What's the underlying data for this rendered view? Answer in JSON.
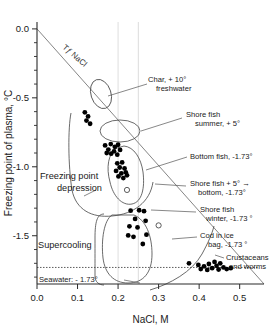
{
  "chart_data": {
    "type": "scatter",
    "title": "",
    "xlabel": "NaCl, M",
    "ylabel": "Freezing point of plasma, °C",
    "xlim": [
      0.0,
      0.56
    ],
    "ylim": [
      -1.85,
      0.05
    ],
    "xticks": [
      "0.0",
      "0.1",
      "0.2",
      "0.3",
      "0.4",
      "0.5"
    ],
    "xtick_values": [
      0.0,
      0.1,
      0.2,
      0.3,
      0.4,
      0.5
    ],
    "yticks": [
      "0.0",
      "-0.5",
      "-1.0",
      "-1.5"
    ],
    "ytick_values": [
      0.0,
      -0.5,
      -1.0,
      -1.5
    ],
    "ytick_minor_values": [
      -0.1,
      -0.2,
      -0.3,
      -0.4,
      -0.6,
      -0.7,
      -0.8,
      -0.9,
      -1.1,
      -1.2,
      -1.3,
      -1.4,
      -1.6,
      -1.7,
      -1.8
    ],
    "grid": "faint vertical gridlines at 0.20 and 0.25",
    "gridline_x_values": [
      0.2,
      0.25
    ],
    "legend_position": "none",
    "reference_lines": [
      {
        "name": "tf-nacl-line",
        "label": "Tƒ NaCl",
        "description": "freezing point depression line of NaCl solution",
        "from": [
          0.0,
          0.0
        ],
        "to": [
          0.56,
          -1.85
        ]
      },
      {
        "name": "seawater-line",
        "label": "Seawater: - 1.73°",
        "style": "dotted horizontal",
        "y_value": -1.73
      }
    ],
    "series": [
      {
        "name": "Char, + 10° freshwater",
        "marker": "filled-circle",
        "points": [
          [
            0.118,
            -0.605
          ],
          [
            0.126,
            -0.635
          ],
          [
            0.122,
            -0.665
          ],
          [
            0.131,
            -0.688
          ]
        ]
      },
      {
        "name": "Shore fish summer, + 5°",
        "marker": "filled-circle",
        "points": [
          [
            0.168,
            -0.845
          ],
          [
            0.182,
            -0.835
          ],
          [
            0.192,
            -0.855
          ],
          [
            0.2,
            -0.84
          ],
          [
            0.176,
            -0.875
          ],
          [
            0.19,
            -0.888
          ],
          [
            0.205,
            -0.878
          ],
          [
            0.183,
            -0.905
          ],
          [
            0.198,
            -0.912
          ],
          [
            0.172,
            -0.9
          ]
        ]
      },
      {
        "name": "Bottom fish, -1.73°",
        "marker": "filled-circle",
        "points": [
          [
            0.198,
            -0.975
          ],
          [
            0.21,
            -0.968
          ],
          [
            0.204,
            -1.005
          ],
          [
            0.216,
            -1.012
          ],
          [
            0.195,
            -1.03
          ],
          [
            0.208,
            -1.048
          ],
          [
            0.219,
            -1.04
          ],
          [
            0.201,
            -1.07
          ],
          [
            0.213,
            -1.082
          ],
          [
            0.222,
            -1.062
          ]
        ]
      },
      {
        "name": "Shore fish winter, -1.73° (open marker within bottom-fish envelope)",
        "marker": "open-circle",
        "points": [
          [
            0.222,
            -1.168
          ]
        ]
      },
      {
        "name": "Cod in ice bag, -1.73°",
        "marker": "open-circle",
        "points": [
          [
            0.3,
            -1.425
          ]
        ]
      },
      {
        "name": "Supercooling",
        "marker": "filled-circle",
        "points": [
          [
            0.231,
            -1.318
          ],
          [
            0.252,
            -1.315
          ],
          [
            0.264,
            -1.322
          ],
          [
            0.242,
            -1.378
          ],
          [
            0.268,
            -1.392
          ],
          [
            0.228,
            -1.432
          ],
          [
            0.248,
            -1.44
          ],
          [
            0.225,
            -1.498
          ],
          [
            0.238,
            -1.508
          ],
          [
            0.27,
            -1.492
          ],
          [
            0.261,
            -1.56
          ]
        ]
      },
      {
        "name": "Crustaceans and worms",
        "marker": "filled-circle",
        "points": [
          [
            0.375,
            -1.7
          ],
          [
            0.398,
            -1.712
          ],
          [
            0.404,
            -1.742
          ],
          [
            0.412,
            -1.722
          ],
          [
            0.42,
            -1.748
          ],
          [
            0.424,
            -1.705
          ],
          [
            0.432,
            -1.735
          ],
          [
            0.438,
            -1.69
          ],
          [
            0.443,
            -1.718
          ],
          [
            0.448,
            -1.745
          ],
          [
            0.452,
            -1.7
          ],
          [
            0.46,
            -1.73
          ],
          [
            0.468,
            -1.742
          ],
          [
            0.478,
            -1.735
          ]
        ]
      }
    ],
    "annotations": [
      {
        "name": "annotation-tf-nacl",
        "text": "Tƒ NaCl",
        "rotated": true
      },
      {
        "name": "annotation-char",
        "line1": "Char, + 10°",
        "line2": "freshwater"
      },
      {
        "name": "annotation-shore-fish-summer",
        "line1": "Shore fish",
        "line2": "summer, + 5°"
      },
      {
        "name": "annotation-bottom-fish",
        "line1": "Bottom fish, -1.73°",
        "line2": ""
      },
      {
        "name": "annotation-shore-fish-transition",
        "line1": "Shore fish + 5° →",
        "line2": "bottom, -1.73°"
      },
      {
        "name": "annotation-shore-fish-winter",
        "line1": "Shore fish",
        "line2": "winter, -1.73 °"
      },
      {
        "name": "annotation-cod-in-ice-bag",
        "line1": "Cod in ice",
        "line2": "bag, -1.73 °"
      },
      {
        "name": "annotation-crustaceans-worms",
        "line1": "Crustaceans",
        "line2": "and worms"
      },
      {
        "name": "annotation-freezing-point-depression",
        "line1": "Freezing point",
        "line2": "depression"
      },
      {
        "name": "annotation-supercooling",
        "line1": "Supercooling",
        "line2": ""
      },
      {
        "name": "annotation-seawater",
        "line1": "Seawater: - 1.73°",
        "line2": ""
      }
    ]
  },
  "axes": {
    "x_title": "NaCl, M",
    "y_title": "Freezing point of plasma, °C",
    "x_ticks": [
      "0.0",
      "0.1",
      "0.2",
      "0.3",
      "0.4",
      "0.5"
    ],
    "y_ticks": [
      "0.0",
      "-0.5",
      "-1.0",
      "-1.5"
    ]
  },
  "labels": {
    "tf_nacl": "Tƒ NaCl",
    "char_l1": "Char, + 10°",
    "char_l2": "freshwater",
    "shore_summer_l1": "Shore fish",
    "shore_summer_l2": "summer, + 5°",
    "bottom_fish": "Bottom fish, -1.73°",
    "transition_l1": "Shore fish + 5° →",
    "transition_l2": "bottom, -1.73°",
    "shore_winter_l1": "Shore fish",
    "shore_winter_l2": "winter, -1.73 °",
    "cod_l1": "Cod in ice",
    "cod_l2": "bag, -1.73 °",
    "crustaceans_l1": "Crustaceans",
    "crustaceans_l2": "and worms",
    "fpd_l1": "Freezing point",
    "fpd_l2": "depression",
    "supercooling": "Supercooling",
    "seawater": "Seawater: - 1.73°"
  }
}
